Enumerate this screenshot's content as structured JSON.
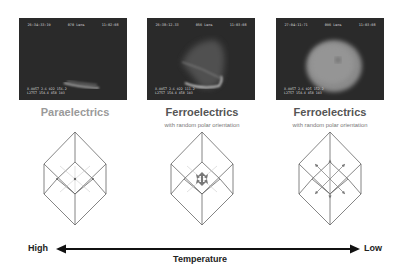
{
  "panels": [
    {
      "title": "Paraelectrics",
      "subtitle": "",
      "title_color": "#9a9a9a",
      "photo": {
        "header": [
          "26:34:33:19",
          "070 Lens",
          "11:02:08"
        ],
        "footer": [
          "X.0057 2.6 022 156.2",
          "L2757 154.4 458 103"
        ]
      },
      "cube_icon": "cube-center-dot-icon"
    },
    {
      "title": "Ferroelectrics",
      "subtitle": "with random polar orientation",
      "title_color": "#555555",
      "photo": {
        "header": [
          "26:38:12.33",
          "056 Lens",
          "11:03:08"
        ],
        "footer": [
          "X.0057 2.6 022 111.2",
          "L2757 154.4 458 103"
        ]
      },
      "cube_icon": "cube-small-polar-arrows-icon"
    },
    {
      "title": "Ferroelectrics",
      "subtitle": "with random polar orientation",
      "title_color": "#555555",
      "photo": {
        "header": [
          "27:04:11:71",
          "096 Lens",
          "11:03:08"
        ],
        "footer": [
          "X.0057 2.6 025 152.2",
          "L2757 154.4 458 103"
        ]
      },
      "cube_icon": "cube-large-polar-arrows-icon"
    }
  ],
  "axis": {
    "left_label": "High",
    "right_label": "Low",
    "caption": "Temperature"
  },
  "colors": {
    "line": "#555555",
    "arrow": "#111111",
    "photo_bg": "#2a2a2a"
  }
}
